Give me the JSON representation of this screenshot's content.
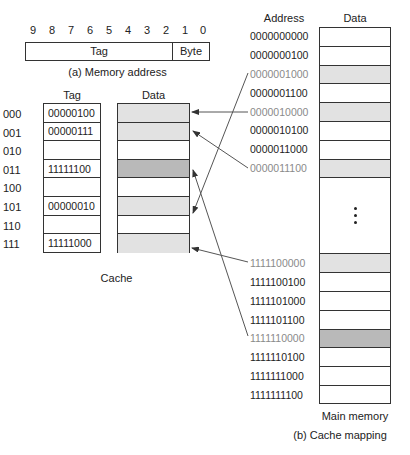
{
  "memory_address": {
    "bit_numbers": [
      "9",
      "8",
      "7",
      "6",
      "5",
      "4",
      "3",
      "2",
      "1",
      "0"
    ],
    "tag_label": "Tag",
    "byte_label": "Byte",
    "caption": "(a) Memory address"
  },
  "cache": {
    "tag_header": "Tag",
    "data_header": "Data",
    "caption": "Cache",
    "rows": [
      {
        "index": "000",
        "tag": "00000100",
        "shade": "light"
      },
      {
        "index": "001",
        "tag": "00000111",
        "shade": "light"
      },
      {
        "index": "010",
        "tag": "",
        "shade": "none"
      },
      {
        "index": "011",
        "tag": "11111100",
        "shade": "dark"
      },
      {
        "index": "100",
        "tag": "",
        "shade": "none"
      },
      {
        "index": "101",
        "tag": "00000010",
        "shade": "light"
      },
      {
        "index": "110",
        "tag": "",
        "shade": "none"
      },
      {
        "index": "111",
        "tag": "11111000",
        "shade": "light"
      }
    ]
  },
  "main_memory": {
    "address_header": "Address",
    "data_header": "Data",
    "caption": "Main memory",
    "ellipsis": "⋮",
    "top_rows": [
      {
        "address": "0000000000",
        "shade": "none",
        "mapped": false
      },
      {
        "address": "0000000100",
        "shade": "none",
        "mapped": false
      },
      {
        "address": "0000001000",
        "shade": "light",
        "mapped": true
      },
      {
        "address": "0000001100",
        "shade": "none",
        "mapped": false
      },
      {
        "address": "0000010000",
        "shade": "light",
        "mapped": true
      },
      {
        "address": "0000010100",
        "shade": "none",
        "mapped": false
      },
      {
        "address": "0000011000",
        "shade": "none",
        "mapped": false
      },
      {
        "address": "0000011100",
        "shade": "light",
        "mapped": true
      }
    ],
    "bottom_rows": [
      {
        "address": "1111100000",
        "shade": "light",
        "mapped": true
      },
      {
        "address": "1111100100",
        "shade": "none",
        "mapped": false
      },
      {
        "address": "1111101000",
        "shade": "none",
        "mapped": false
      },
      {
        "address": "1111101100",
        "shade": "none",
        "mapped": false
      },
      {
        "address": "1111110000",
        "shade": "dark",
        "mapped": true
      },
      {
        "address": "1111110100",
        "shade": "none",
        "mapped": false
      },
      {
        "address": "1111111000",
        "shade": "none",
        "mapped": false
      },
      {
        "address": "1111111100",
        "shade": "none",
        "mapped": false
      }
    ]
  },
  "mappings": [
    {
      "from": "0000001000",
      "to_cache_index": "101"
    },
    {
      "from": "0000010000",
      "to_cache_index": "000"
    },
    {
      "from": "0000011100",
      "to_cache_index": "001"
    },
    {
      "from": "1111100000",
      "to_cache_index": "111"
    },
    {
      "from": "1111110000",
      "to_cache_index": "011"
    }
  ],
  "figure_caption": "(b) Cache mapping",
  "colors": {
    "shade_light": "#e2e2e2",
    "shade_dark": "#b9b9b9",
    "mapped_address_text": "#8a8a8a",
    "line": "#333333"
  }
}
